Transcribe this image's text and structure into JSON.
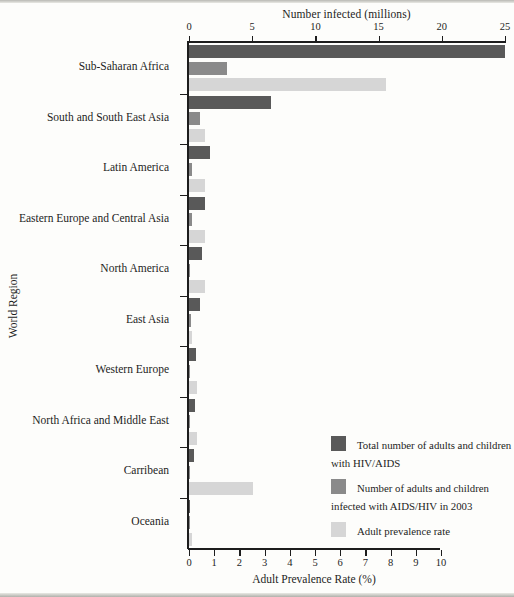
{
  "chart_data": {
    "type": "bar",
    "orientation": "horizontal",
    "title": "",
    "xlabel": "Number infected (millions)",
    "xlabel2": "Adult Prevalence Rate (%)",
    "ylabel": "World Region",
    "grid": false,
    "legend_position": "inside-bottom-right",
    "top_axis": {
      "label": "Number infected (millions)",
      "ticks": [
        0,
        5,
        10,
        15,
        20,
        25
      ],
      "tick_labels": [
        "0",
        "5",
        "10",
        "15",
        "20",
        "25"
      ],
      "lim": [
        0,
        25
      ]
    },
    "bottom_axis": {
      "label": "Adult Prevalence Rate (%)",
      "ticks": [
        0,
        1,
        2,
        3,
        4,
        5,
        6,
        7,
        8,
        9,
        10
      ],
      "tick_labels": [
        "0",
        "1",
        "2",
        "3",
        "4",
        "5",
        "6",
        "7",
        "8",
        "9",
        "10"
      ],
      "lim": [
        0,
        10
      ]
    },
    "categories": [
      "Sub-Saharan Africa",
      "South and South East Asia",
      "Latin America",
      "Eastern Europe and Central Asia",
      "North America",
      "East Asia",
      "Western Europe",
      "North  Africa and Middle East",
      "Carribean",
      "Oceania"
    ],
    "series": [
      {
        "name": "Total number of adults and children with HIV/AIDS",
        "axis": "top",
        "unit": "millions",
        "color": "#595959",
        "values": [
          25.0,
          6.5,
          1.7,
          1.3,
          1.0,
          0.9,
          0.58,
          0.48,
          0.43,
          0.035
        ]
      },
      {
        "name": "Number of adults and children infected with AIDS/HIV in 2003",
        "axis": "top",
        "unit": "millions",
        "color": "#8a8a8a",
        "values": [
          3.0,
          0.85,
          0.2,
          0.23,
          0.1,
          0.15,
          0.02,
          0.07,
          0.05,
          0.005
        ]
      },
      {
        "name": "Adult prevalence rate",
        "axis": "bottom",
        "unit": "percent",
        "color": "#d6d6d6",
        "values": [
          7.8,
          0.62,
          0.62,
          0.62,
          0.62,
          0.12,
          0.32,
          0.32,
          2.52,
          0.12
        ]
      }
    ]
  },
  "legend": {
    "items": [
      {
        "label": "Total number of adults and children with HIV/AIDS",
        "color": "#595959"
      },
      {
        "label": "Number of adults and children infected with AIDS/HIV in 2003",
        "color": "#8a8a8a"
      },
      {
        "label": "Adult prevalence rate",
        "color": "#d6d6d6"
      }
    ]
  }
}
